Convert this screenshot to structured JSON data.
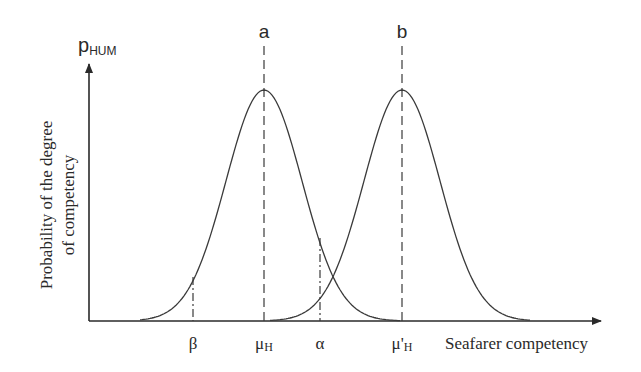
{
  "diagram": {
    "y_axis_symbol_main": "p",
    "y_axis_symbol_sub": "HUM",
    "y_axis_label_line1": "Probability of the degree",
    "y_axis_label_line2": "of competency",
    "x_axis_label": "Seafarer competency",
    "curve_a_label": "a",
    "curve_b_label": "b",
    "ticks": {
      "beta": "β",
      "mu_h_main": "μ",
      "mu_h_sub": "H",
      "alpha": "α",
      "mu_h_prime_main": "μ'",
      "mu_h_prime_sub": "H"
    }
  },
  "chart_data": {
    "type": "line",
    "title": "",
    "xlabel": "Seafarer competency",
    "ylabel": "Probability of the degree of competency (p_HUM)",
    "series": [
      {
        "name": "a",
        "distribution": "normal",
        "mean_label": "μH",
        "mean_x_px": 264,
        "peak_y_px": 90
      },
      {
        "name": "b",
        "distribution": "normal",
        "mean_label": "μ'H",
        "mean_x_px": 402,
        "peak_y_px": 90
      }
    ],
    "markers": [
      {
        "label": "β",
        "x_px": 193,
        "style": "dash-dot"
      },
      {
        "label": "μH",
        "x_px": 264,
        "style": "dashed"
      },
      {
        "label": "α",
        "x_px": 320,
        "style": "dash-dot"
      },
      {
        "label": "μ'H",
        "x_px": 402,
        "style": "dashed"
      }
    ],
    "grid": false,
    "legend": "none"
  }
}
